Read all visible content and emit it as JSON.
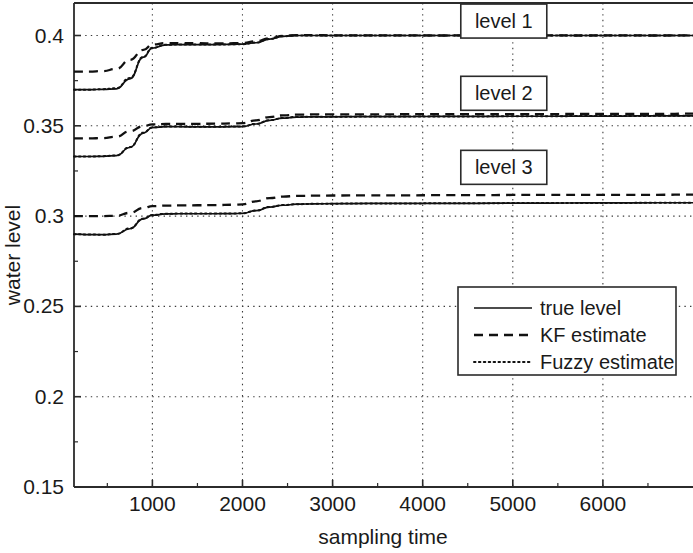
{
  "chart_data": {
    "type": "line",
    "title": "",
    "xlabel": "sampling time",
    "ylabel": "water level",
    "xlim": [
      130,
      7000
    ],
    "ylim": [
      0.15,
      0.418
    ],
    "grid": true,
    "xticks": [
      1000,
      2000,
      3000,
      4000,
      5000,
      6000
    ],
    "xtick_labels": [
      "1000",
      "2000",
      "3000",
      "4000",
      "5000",
      "6000"
    ],
    "yticks": [
      0.15,
      0.2,
      0.25,
      0.3,
      0.35,
      0.4
    ],
    "ytick_labels": [
      "0.15",
      "0.2",
      "0.25",
      "0.3",
      "0.35",
      "0.4"
    ],
    "legend_position": "center-right",
    "legend": [
      {
        "label": "true level",
        "style": "solid"
      },
      {
        "label": "KF estimate",
        "style": "dashed"
      },
      {
        "label": "Fuzzy estimate",
        "style": "dotted"
      }
    ],
    "annotations": [
      {
        "text": "level 1",
        "x": 4900,
        "y": 0.408
      },
      {
        "text": "level 2",
        "x": 4900,
        "y": 0.368
      },
      {
        "text": "level 3",
        "x": 4900,
        "y": 0.327
      }
    ],
    "x": [
      130,
      300,
      450,
      600,
      750,
      900,
      1000,
      1150,
      1300,
      1500,
      1700,
      1900,
      2000,
      2150,
      2300,
      2450,
      2600,
      2800,
      3000,
      3400,
      3800,
      4200,
      4600,
      5000,
      5400,
      5800,
      6200,
      6600,
      7000
    ],
    "series": [
      {
        "name": "level 1 true level",
        "group": "level 1",
        "style": "solid",
        "values": [
          0.37,
          0.37,
          0.3702,
          0.3705,
          0.376,
          0.388,
          0.393,
          0.3948,
          0.395,
          0.395,
          0.395,
          0.3951,
          0.3952,
          0.396,
          0.398,
          0.3995,
          0.4,
          0.4,
          0.4,
          0.4,
          0.4,
          0.4,
          0.4,
          0.4,
          0.4,
          0.4,
          0.4,
          0.4,
          0.4
        ]
      },
      {
        "name": "level 1 KF estimate",
        "group": "level 1",
        "style": "dashed",
        "values": [
          0.38,
          0.38,
          0.3803,
          0.3815,
          0.3865,
          0.392,
          0.395,
          0.3958,
          0.3958,
          0.3957,
          0.3956,
          0.3957,
          0.3958,
          0.3968,
          0.3985,
          0.3998,
          0.4002,
          0.4002,
          0.4001,
          0.4001,
          0.4001,
          0.4,
          0.4001,
          0.4,
          0.4001,
          0.4,
          0.4001,
          0.4,
          0.4001
        ]
      },
      {
        "name": "level 1 Fuzzy estimate",
        "group": "level 1",
        "style": "dotted",
        "values": [
          0.37,
          0.37,
          0.3703,
          0.3708,
          0.3765,
          0.3882,
          0.3932,
          0.3949,
          0.395,
          0.395,
          0.395,
          0.3951,
          0.3952,
          0.3961,
          0.3981,
          0.3996,
          0.4,
          0.4,
          0.4,
          0.4,
          0.4,
          0.4,
          0.4,
          0.4,
          0.4,
          0.4,
          0.4,
          0.4,
          0.4
        ]
      },
      {
        "name": "level 2 true level",
        "group": "level 2",
        "style": "solid",
        "values": [
          0.333,
          0.333,
          0.3331,
          0.3335,
          0.338,
          0.346,
          0.349,
          0.3495,
          0.3495,
          0.3494,
          0.3494,
          0.3495,
          0.3496,
          0.351,
          0.353,
          0.3542,
          0.3548,
          0.355,
          0.355,
          0.3551,
          0.3551,
          0.3552,
          0.3552,
          0.3553,
          0.3553,
          0.3554,
          0.3554,
          0.3555,
          0.3555
        ]
      },
      {
        "name": "level 2 KF estimate",
        "group": "level 2",
        "style": "dashed",
        "values": [
          0.343,
          0.343,
          0.3432,
          0.344,
          0.347,
          0.3498,
          0.3508,
          0.351,
          0.3511,
          0.3511,
          0.3512,
          0.3513,
          0.3515,
          0.353,
          0.3548,
          0.3558,
          0.3562,
          0.3563,
          0.3563,
          0.3563,
          0.3564,
          0.3564,
          0.3565,
          0.3565,
          0.3565,
          0.3566,
          0.3566,
          0.3566,
          0.3567
        ]
      },
      {
        "name": "level 2 Fuzzy estimate",
        "group": "level 2",
        "style": "dotted",
        "values": [
          0.333,
          0.333,
          0.3332,
          0.3336,
          0.3382,
          0.3462,
          0.3491,
          0.3496,
          0.3496,
          0.3495,
          0.3495,
          0.3496,
          0.3497,
          0.3511,
          0.3531,
          0.3543,
          0.3549,
          0.355,
          0.355,
          0.3551,
          0.3551,
          0.3552,
          0.3552,
          0.3553,
          0.3553,
          0.3554,
          0.3554,
          0.3555,
          0.3555
        ]
      },
      {
        "name": "level 3 true level",
        "group": "level 3",
        "style": "solid",
        "values": [
          0.29,
          0.2898,
          0.2897,
          0.29,
          0.293,
          0.2985,
          0.3005,
          0.3012,
          0.3013,
          0.3013,
          0.3013,
          0.3014,
          0.3015,
          0.303,
          0.305,
          0.306,
          0.3066,
          0.3068,
          0.3069,
          0.307,
          0.307,
          0.3071,
          0.3071,
          0.3072,
          0.3072,
          0.3073,
          0.3073,
          0.3074,
          0.3074
        ]
      },
      {
        "name": "level 3 KF estimate",
        "group": "level 3",
        "style": "dashed",
        "values": [
          0.3,
          0.3,
          0.3,
          0.3002,
          0.3018,
          0.3045,
          0.3055,
          0.3058,
          0.3059,
          0.306,
          0.3061,
          0.3063,
          0.3065,
          0.3082,
          0.31,
          0.3108,
          0.3112,
          0.3113,
          0.3114,
          0.3115,
          0.3115,
          0.3116,
          0.3116,
          0.3117,
          0.3117,
          0.3118,
          0.3118,
          0.3118,
          0.3119
        ]
      },
      {
        "name": "level 3 Fuzzy estimate",
        "group": "level 3",
        "style": "dotted",
        "values": [
          0.29,
          0.2898,
          0.2897,
          0.2901,
          0.2932,
          0.2986,
          0.3006,
          0.3013,
          0.3014,
          0.3014,
          0.3014,
          0.3015,
          0.3016,
          0.3031,
          0.3051,
          0.3061,
          0.3066,
          0.3068,
          0.3069,
          0.307,
          0.307,
          0.3071,
          0.3071,
          0.3072,
          0.3072,
          0.3073,
          0.3073,
          0.3074,
          0.3074
        ]
      }
    ]
  }
}
